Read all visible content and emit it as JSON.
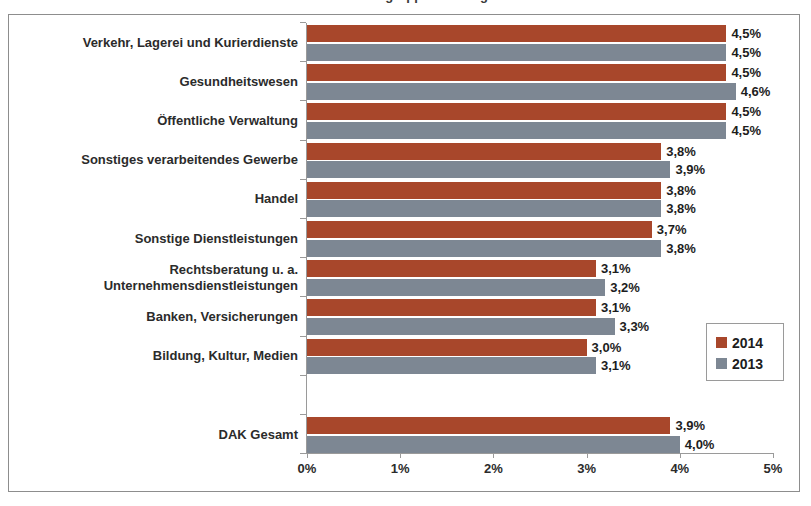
{
  "figure": {
    "title_partial": "Krankenstand nach Branchengruppen im Vergleich 2013 und 2014",
    "frame_color": "#8d8d8d"
  },
  "legend": {
    "position": "inside-right-lower",
    "entries": [
      {
        "label": "2014",
        "color": "#a8472b"
      },
      {
        "label": "2013",
        "color": "#7d8793"
      }
    ]
  },
  "axis": {
    "x_ticks": [
      "0%",
      "1%",
      "2%",
      "3%",
      "4%",
      "5%"
    ],
    "x_tick_values": [
      0,
      1,
      2,
      3,
      4,
      5
    ]
  },
  "chart_data": {
    "type": "bar",
    "orientation": "horizontal",
    "title": "Krankenstand nach Branchengruppen im Vergleich 2013 und 2014",
    "xlabel": "",
    "ylabel": "",
    "xlim": [
      0,
      5
    ],
    "xtick_labels": [
      "0%",
      "1%",
      "2%",
      "3%",
      "4%",
      "5%"
    ],
    "grid": false,
    "legend_position": "inside right",
    "unit": "%",
    "decimal_separator": ",",
    "categories": [
      "Verkehr, Lagerei und Kurierdienste",
      "Gesundheitswesen",
      "Öffentliche Verwaltung",
      "Sonstiges verarbeitendes Gewerbe",
      "Handel",
      "Sonstige Dienstleistungen",
      "Rechtsberatung u. a. Unternehmensdienstleistungen",
      "Banken, Versicherungen",
      "Bildung, Kultur, Medien",
      "",
      "DAK Gesamt"
    ],
    "series": [
      {
        "name": "2014",
        "color": "#a8472b",
        "values": [
          4.5,
          4.5,
          4.5,
          3.8,
          3.8,
          3.7,
          3.1,
          3.1,
          3.0,
          null,
          3.9
        ],
        "labels": [
          "4,5%",
          "4,5%",
          "4,5%",
          "3,8%",
          "3,8%",
          "3,7%",
          "3,1%",
          "3,1%",
          "3,0%",
          "",
          "3,9%"
        ]
      },
      {
        "name": "2013",
        "color": "#7d8793",
        "values": [
          4.5,
          4.6,
          4.5,
          3.9,
          3.8,
          3.8,
          3.2,
          3.3,
          3.1,
          null,
          4.0
        ],
        "labels": [
          "4,5%",
          "4,6%",
          "4,5%",
          "3,9%",
          "3,8%",
          "3,8%",
          "3,2%",
          "3,3%",
          "3,1%",
          "",
          "4,0%"
        ]
      }
    ]
  }
}
